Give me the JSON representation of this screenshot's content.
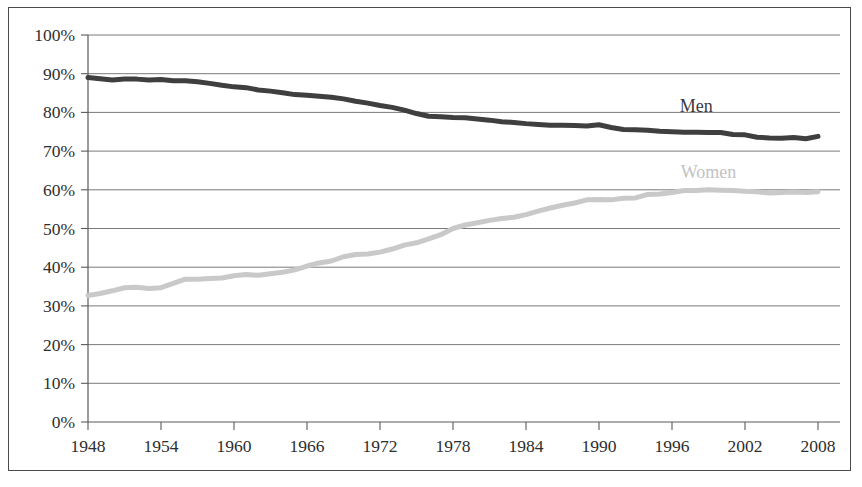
{
  "chart_data": {
    "type": "line",
    "title": "",
    "subtitle": "",
    "xlabel": "",
    "ylabel": "",
    "xlim": [
      1948,
      2008
    ],
    "ylim": [
      0,
      1.0
    ],
    "grid": true,
    "legend_position": "inline-annotation",
    "y_tick_labels": [
      "100%",
      "90%",
      "80%",
      "70%",
      "60%",
      "50%",
      "40%",
      "30%",
      "20%",
      "10%",
      "0%"
    ],
    "y_tick_values": [
      100,
      90,
      80,
      70,
      60,
      50,
      40,
      30,
      20,
      10,
      0
    ],
    "x_tick_labels": [
      "1948",
      "1954",
      "1960",
      "1966",
      "1972",
      "1978",
      "1984",
      "1990",
      "1996",
      "2002",
      "2008"
    ],
    "x_tick_values": [
      1948,
      1954,
      1960,
      1966,
      1972,
      1978,
      1984,
      1990,
      1996,
      2002,
      2008
    ],
    "x": [
      1948,
      1949,
      1950,
      1951,
      1952,
      1953,
      1954,
      1955,
      1956,
      1957,
      1958,
      1959,
      1960,
      1961,
      1962,
      1963,
      1964,
      1965,
      1966,
      1967,
      1968,
      1969,
      1970,
      1971,
      1972,
      1973,
      1974,
      1975,
      1976,
      1977,
      1978,
      1979,
      1980,
      1981,
      1982,
      1983,
      1984,
      1985,
      1986,
      1987,
      1988,
      1989,
      1990,
      1991,
      1992,
      1993,
      1994,
      1995,
      1996,
      1997,
      1998,
      1999,
      2000,
      2001,
      2002,
      2003,
      2004,
      2005,
      2006,
      2007,
      2008
    ],
    "series": [
      {
        "name": "Men",
        "color": "#3f3f3f",
        "label_x": 1998,
        "label_y": 80,
        "values": [
          89.0,
          88.7,
          88.4,
          88.6,
          88.6,
          88.4,
          88.5,
          88.2,
          88.2,
          87.9,
          87.5,
          87.0,
          86.6,
          86.4,
          85.8,
          85.5,
          85.1,
          84.6,
          84.4,
          84.2,
          83.9,
          83.5,
          82.9,
          82.4,
          81.8,
          81.3,
          80.6,
          79.7,
          79.0,
          78.9,
          78.7,
          78.6,
          78.3,
          78.0,
          77.6,
          77.4,
          77.1,
          76.9,
          76.7,
          76.7,
          76.6,
          76.5,
          76.8,
          76.1,
          75.6,
          75.5,
          75.4,
          75.1,
          75.0,
          74.9,
          74.9,
          74.8,
          74.8,
          74.3,
          74.2,
          73.6,
          73.4,
          73.3,
          73.5,
          73.2,
          73.8
        ]
      },
      {
        "name": "Women",
        "color": "#c9c9c9",
        "label_x": 1999,
        "label_y": 63,
        "values": [
          32.7,
          33.2,
          33.9,
          34.7,
          34.8,
          34.5,
          34.7,
          35.8,
          36.9,
          36.9,
          37.1,
          37.2,
          37.8,
          38.1,
          37.9,
          38.3,
          38.7,
          39.3,
          40.3,
          41.1,
          41.6,
          42.7,
          43.3,
          43.4,
          43.9,
          44.7,
          45.7,
          46.3,
          47.3,
          48.4,
          50.0,
          50.9,
          51.5,
          52.1,
          52.6,
          52.9,
          53.6,
          54.5,
          55.3,
          56.0,
          56.6,
          57.4,
          57.5,
          57.4,
          57.8,
          57.9,
          58.8,
          58.9,
          59.3,
          59.8,
          59.8,
          60.0,
          59.9,
          59.8,
          59.6,
          59.5,
          59.2,
          59.3,
          59.4,
          59.3,
          59.5
        ]
      }
    ]
  },
  "labels": {
    "men": "Men",
    "women": "Women"
  }
}
